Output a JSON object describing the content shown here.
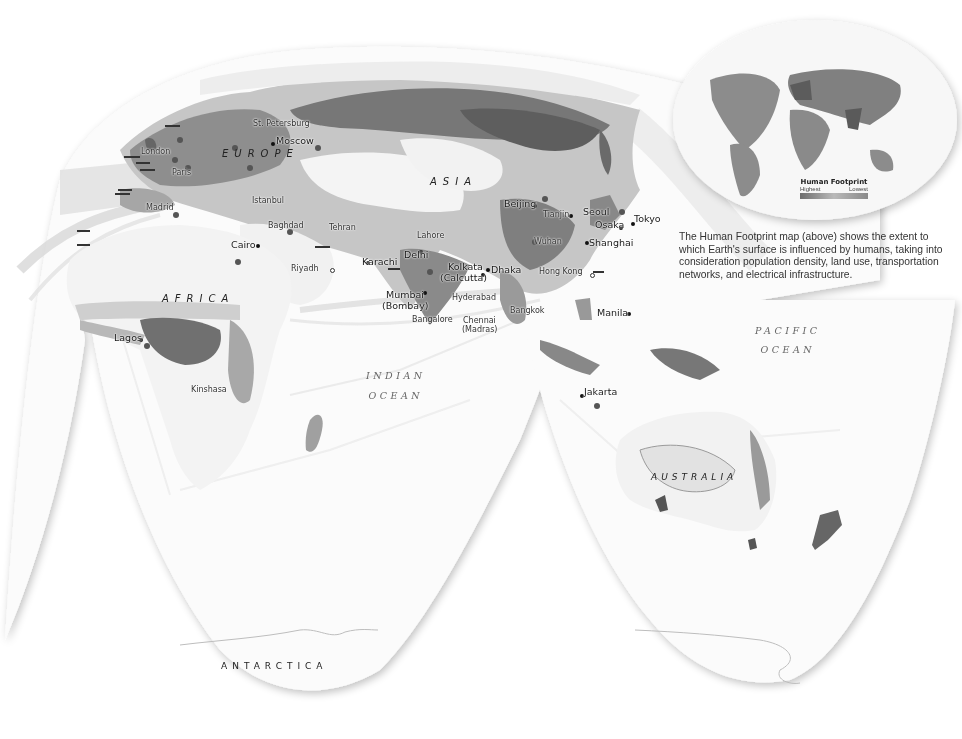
{
  "map": {
    "title": "Human Footprint — Eastern Hemisphere interrupted projection",
    "regions": {
      "europe": "EUROPE",
      "asia": "ASIA",
      "africa": "AFRICA",
      "australia": "AUSTRALIA",
      "antarctica": "ANTARCTICA"
    },
    "oceans": {
      "indian_line1": "INDIAN",
      "indian_line2": "OCEAN",
      "pacific_line1": "PACIFIC",
      "pacific_line2": "OCEAN"
    },
    "cities": {
      "st_petersburg": "St. Petersburg",
      "moscow": "Moscow",
      "london": "London",
      "paris": "Paris",
      "madrid": "Madrid",
      "istanbul": "Istanbul",
      "baghdad": "Baghdad",
      "tehran": "Tehran",
      "cairo": "Cairo",
      "riyadh": "Riyadh",
      "karachi": "Karachi",
      "lahore": "Lahore",
      "delhi": "Delhi",
      "kolkata": "Kolkata",
      "kolkata_alt": "(Calcutta)",
      "dhaka": "Dhaka",
      "mumbai": "Mumbai",
      "mumbai_alt": "(Bombay)",
      "hyderabad": "Hyderabad",
      "bangalore": "Bangalore",
      "chennai": "Chennai",
      "chennai_alt": "(Madras)",
      "beijing": "Beijing",
      "tianjin": "Tianjin",
      "seoul": "Seoul",
      "tokyo": "Tokyo",
      "osaka": "Osaka",
      "wuhan": "Wuhan",
      "shanghai": "Shanghai",
      "hong_kong": "Hong Kong",
      "bangkok": "Bangkok",
      "manila": "Manila",
      "jakarta": "Jakarta",
      "lagos": "Lagos",
      "kinshasa": "Kinshasa"
    }
  },
  "inset": {
    "legend_title": "Human Footprint",
    "legend_high": "Highest",
    "legend_low": "Lowest",
    "caption": "The Human Footprint map (above) shows the extent to which Earth's surface is influenced by humans, taking into consideration population density, land use, transportation networks, and electrical infrastructure."
  },
  "colors": {
    "ocean": "#ffffff",
    "land_low": "#e6e6e6",
    "land_mid": "#b8b8b8",
    "land_high": "#7a7a7a",
    "land_highest": "#555555",
    "shipping_lanes": "#d4d4d4"
  }
}
